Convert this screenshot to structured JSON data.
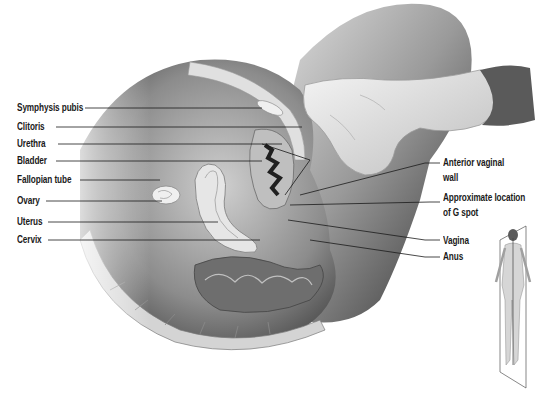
{
  "figure": {
    "type": "anatomical-illustration",
    "colors": {
      "background": "#ffffff",
      "ink": "#1a1a1a",
      "tissue_light": "#d9d9d9",
      "tissue_mid": "#a6a6a6",
      "tissue_dark": "#3a3a3a"
    }
  },
  "labels_left": [
    {
      "id": "symphysis-pubis",
      "text": "Symphysis pubis",
      "x": 17,
      "y": 108
    },
    {
      "id": "clitoris",
      "text": "Clitoris",
      "x": 17,
      "y": 127
    },
    {
      "id": "urethra",
      "text": "Urethra",
      "x": 17,
      "y": 144
    },
    {
      "id": "bladder",
      "text": "Bladder",
      "x": 17,
      "y": 161
    },
    {
      "id": "fallopian-tube",
      "text": "Fallopian tube",
      "x": 17,
      "y": 180
    },
    {
      "id": "ovary",
      "text": "Ovary",
      "x": 17,
      "y": 201
    },
    {
      "id": "uterus",
      "text": "Uterus",
      "x": 17,
      "y": 222
    },
    {
      "id": "cervix",
      "text": "Cervix",
      "x": 17,
      "y": 240
    }
  ],
  "labels_right": [
    {
      "id": "anterior-vaginal-wall",
      "line1": "Anterior vaginal",
      "line2": "wall",
      "x": 443,
      "y": 163
    },
    {
      "id": "g-spot",
      "line1": "Approximate location",
      "line2": "of G spot",
      "x": 443,
      "y": 198
    },
    {
      "id": "vagina",
      "line1": "Vagina",
      "line2": "",
      "x": 443,
      "y": 241
    },
    {
      "id": "anus",
      "line1": "Anus",
      "line2": "",
      "x": 443,
      "y": 257
    }
  ],
  "inset": {
    "description": "Standing female figure with sagittal plane indicator"
  }
}
